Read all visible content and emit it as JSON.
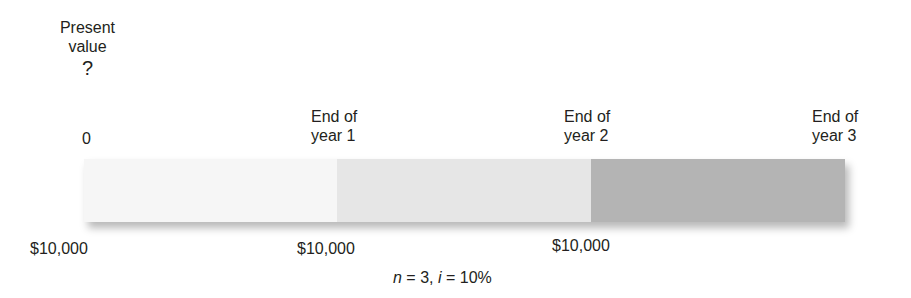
{
  "diagram": {
    "title_block": {
      "line1": "Present",
      "line2": "value",
      "unknown": "?"
    },
    "timeline": {
      "points": [
        {
          "label_line1": "0",
          "label_line2": ""
        },
        {
          "label_line1": "End of",
          "label_line2": "year 1"
        },
        {
          "label_line1": "End of",
          "label_line2": "year 2"
        },
        {
          "label_line1": "End of",
          "label_line2": "year 3"
        }
      ],
      "segments": [
        {
          "period": 1,
          "color": "#f6f6f6"
        },
        {
          "period": 2,
          "color": "#e6e6e6"
        },
        {
          "period": 3,
          "color": "#b4b4b4"
        }
      ]
    },
    "cash_flows": [
      {
        "amount": "$10,000"
      },
      {
        "amount": "$10,000"
      },
      {
        "amount": "$10,000"
      }
    ],
    "parameters": {
      "n_symbol": "n",
      "n_eq": " = 3, ",
      "i_symbol": "i",
      "i_eq": " = 10%"
    }
  }
}
